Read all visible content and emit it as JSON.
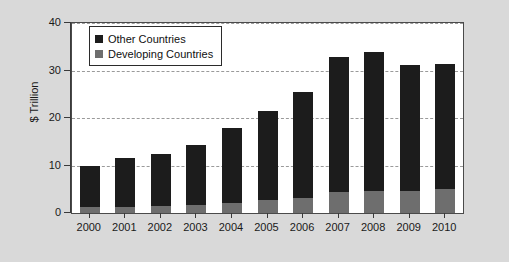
{
  "chart_data": {
    "type": "bar",
    "stacked": true,
    "title": "",
    "subtitle": "",
    "xlabel": "",
    "ylabel": "$ Trillion",
    "categories": [
      "2000",
      "2001",
      "2002",
      "2003",
      "2004",
      "2005",
      "2006",
      "2007",
      "2008",
      "2009",
      "2010"
    ],
    "series": [
      {
        "name": "Developing Countries",
        "color": "#6e6e6e",
        "values": [
          1.2,
          1.3,
          1.4,
          1.6,
          2.1,
          2.7,
          3.2,
          4.4,
          4.6,
          4.7,
          5.0
        ]
      },
      {
        "name": "Other Countries",
        "color": "#1c1c1c",
        "values": [
          8.8,
          10.2,
          11.0,
          12.7,
          15.8,
          18.8,
          22.3,
          28.5,
          29.4,
          26.5,
          26.3
        ]
      }
    ],
    "totals": [
      10.0,
      11.5,
      12.4,
      14.3,
      17.9,
      21.5,
      25.5,
      32.9,
      34.0,
      31.2,
      31.3
    ],
    "ylim": [
      0,
      40
    ],
    "yticks": [
      0,
      10,
      20,
      30,
      40
    ],
    "ytick_labels": [
      "0",
      "10",
      "20",
      "30",
      "40"
    ],
    "grid": true,
    "grid_style": "dashed-horizontal",
    "legend_position": "top-left-inside",
    "plot_background": "#ffffff",
    "figure_background": "#d9d9d9"
  },
  "legend": {
    "items": [
      {
        "label": "Other Countries",
        "color": "#1c1c1c"
      },
      {
        "label": "Developing Countries",
        "color": "#6e6e6e"
      }
    ]
  }
}
